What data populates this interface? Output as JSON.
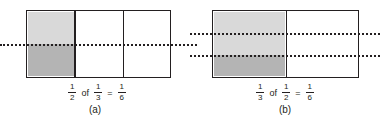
{
  "figure": {
    "colors": {
      "outline": "#231f20",
      "shade_light": "#d9d9d9",
      "shade_dark": "#b4b4b4",
      "background": "#ffffff"
    },
    "panels": [
      {
        "id": "a",
        "caption": "(a)",
        "model": {
          "columns": 3,
          "rows": 2,
          "vertical_dividers": 2,
          "dotted_horizontal_lines": 1,
          "shaded_column_index": 0,
          "light_region": "top half of first column",
          "dark_region": "bottom half of first column"
        },
        "equation": {
          "first": {
            "numerator": "1",
            "denominator": "2"
          },
          "operator_word": "of",
          "second": {
            "numerator": "1",
            "denominator": "3"
          },
          "equals": "=",
          "result": {
            "numerator": "1",
            "denominator": "6"
          }
        }
      },
      {
        "id": "b",
        "caption": "(b)",
        "model": {
          "columns": 2,
          "rows": 3,
          "vertical_dividers": 1,
          "dotted_horizontal_lines": 2,
          "shaded_column_index": 0,
          "light_region": "top two thirds of first column",
          "dark_region": "bottom third of first column"
        },
        "equation": {
          "first": {
            "numerator": "1",
            "denominator": "3"
          },
          "operator_word": "of",
          "second": {
            "numerator": "1",
            "denominator": "2"
          },
          "equals": "=",
          "result": {
            "numerator": "1",
            "denominator": "6"
          }
        }
      }
    ]
  }
}
